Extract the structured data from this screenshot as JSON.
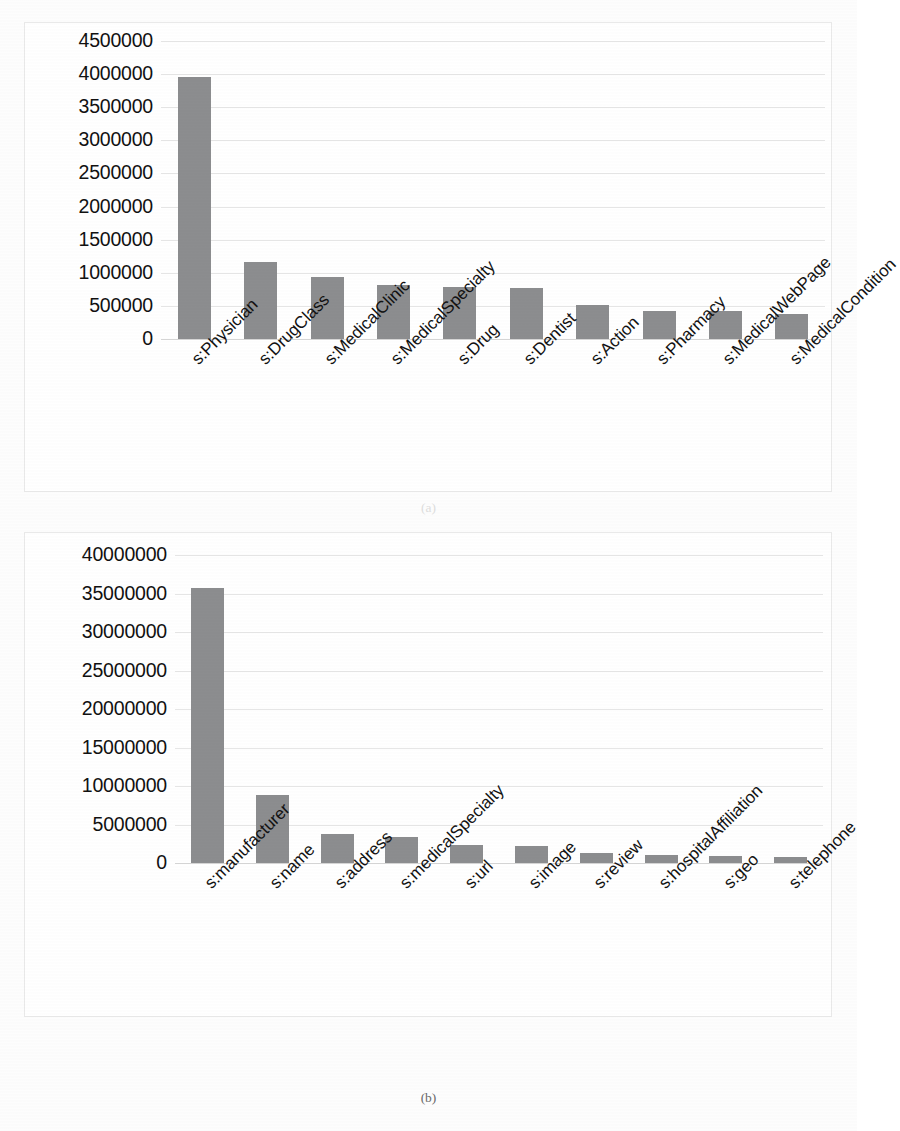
{
  "figure": {
    "caption_a": "(a)",
    "caption_b": "(b)",
    "bar_color": "#8c8d8f",
    "gridline_color": "#e6e6e6",
    "panel_border_color": "#e9e9e9"
  },
  "chart_data": [
    {
      "id": "a",
      "type": "bar",
      "title": "",
      "xlabel": "",
      "ylabel": "",
      "grid": true,
      "legend": "none",
      "ylim": [
        0,
        4500000
      ],
      "ytick_labels": [
        "4500000",
        "4000000",
        "3500000",
        "3000000",
        "2500000",
        "2000000",
        "1500000",
        "1000000",
        "500000",
        "0"
      ],
      "yticks": [
        4500000,
        4000000,
        3500000,
        3000000,
        2500000,
        2000000,
        1500000,
        1000000,
        500000,
        0
      ],
      "categories": [
        "s:Physician",
        "s:DrugClass",
        "s:MedicalClinic",
        "s:MedicalSpecialty",
        "s:Drug",
        "s:Dentist",
        "s:Action",
        "s:Pharmacy",
        "s:MedicalWebPage",
        "s:MedicalCondition"
      ],
      "values": [
        3950000,
        1170000,
        930000,
        820000,
        780000,
        775000,
        520000,
        430000,
        420000,
        380000
      ]
    },
    {
      "id": "b",
      "type": "bar",
      "title": "",
      "xlabel": "",
      "ylabel": "",
      "grid": true,
      "legend": "none",
      "ylim": [
        0,
        40000000
      ],
      "ytick_labels": [
        "40000000",
        "35000000",
        "30000000",
        "25000000",
        "20000000",
        "15000000",
        "10000000",
        "5000000",
        "0"
      ],
      "yticks": [
        40000000,
        35000000,
        30000000,
        25000000,
        20000000,
        15000000,
        10000000,
        5000000,
        0
      ],
      "categories": [
        "s:manufacturer",
        "s:name",
        "s:address",
        "s:medicalSpecialty",
        "s:url",
        "s:image",
        "s:review",
        "s:hospitalAffiliation",
        "s:geo",
        "s:telephone"
      ],
      "values": [
        35700000,
        8800000,
        3800000,
        3400000,
        2300000,
        2150000,
        1300000,
        1050000,
        950000,
        800000
      ]
    }
  ]
}
